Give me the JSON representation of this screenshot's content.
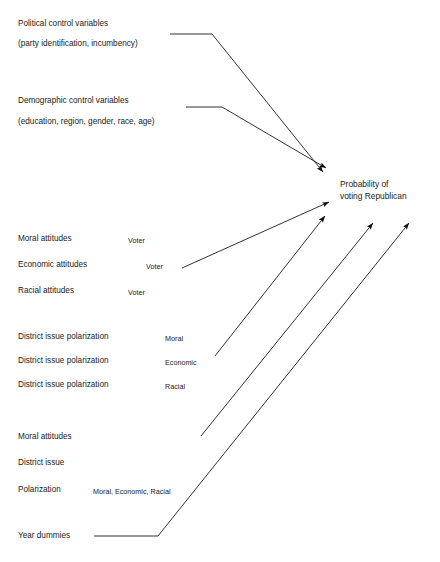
{
  "diagram": {
    "type": "path-diagram",
    "background_color": "#ffffff",
    "line_color": "#1a1a1a",
    "text_color": "#1a1a1a",
    "target": {
      "label": "Probability of\nvoting Republican",
      "line1": "Probability of",
      "line2": "voting Republican",
      "x": 340,
      "y": 178
    },
    "blocks": [
      {
        "id": "political-controls",
        "rows": [
          {
            "main": "Political control variables",
            "sub": "",
            "sub_x": 0,
            "y": 20
          },
          {
            "main": "(party identification, incumbency)",
            "sub": "",
            "sub_x": 0,
            "y": 40
          }
        ]
      },
      {
        "id": "demographic-controls",
        "rows": [
          {
            "main": "Demographic control variables",
            "sub": "",
            "sub_x": 0,
            "y": 97
          },
          {
            "main": "(education, region, gender, race, age)",
            "sub": "",
            "sub_x": 0,
            "y": 118
          }
        ]
      },
      {
        "id": "voter-attitudes",
        "rows": [
          {
            "main": "Moral attitudes",
            "sub": "Voter",
            "sub_x": 128,
            "y": 235
          },
          {
            "main": "Economic attitudes",
            "sub": "Voter",
            "sub_x": 146,
            "y": 261
          },
          {
            "main": "Racial attitudes",
            "sub": "Voter",
            "sub_x": 128,
            "y": 287
          }
        ]
      },
      {
        "id": "district-issue-polarization",
        "rows": [
          {
            "main": "District issue polarization",
            "sub": "Moral",
            "sub_x": 165,
            "y": 333
          },
          {
            "main": "District issue polarization",
            "sub": "Economic",
            "sub_x": 165,
            "y": 357
          },
          {
            "main": "District issue polarization",
            "sub": "Racial",
            "sub_x": 165,
            "y": 381
          }
        ]
      },
      {
        "id": "moral-district-polarization",
        "rows": [
          {
            "main": "Moral attitudes",
            "sub": "",
            "sub_x": 0,
            "y": 433
          },
          {
            "main": "District issue",
            "sub": "",
            "sub_x": 0,
            "y": 459
          },
          {
            "main": "Polarization",
            "sub": "Moral, Economic, Racial",
            "sub_x": 93,
            "y": 486
          }
        ]
      },
      {
        "id": "year-dummies",
        "rows": [
          {
            "main": "Year dummies",
            "sub": "",
            "sub_x": 0,
            "y": 532
          }
        ]
      }
    ],
    "arrows": [
      {
        "id": "arrow-political-controls",
        "from": "political-controls",
        "to": "target",
        "kind": "elbow",
        "points": "170,34 212,34 323,172"
      },
      {
        "id": "arrow-demographic-controls",
        "from": "demographic-controls",
        "to": "target",
        "kind": "elbow",
        "points": "186,107 222,107 326,168"
      },
      {
        "id": "arrow-voter-attitudes",
        "from": "voter-attitudes",
        "to": "target",
        "kind": "straight",
        "points": "182,268 329,202"
      },
      {
        "id": "arrow-district-issue-polarization",
        "from": "district-issue-polarization",
        "to": "target",
        "kind": "straight",
        "points": "215,356 325,216"
      },
      {
        "id": "arrow-moral-district-polarization",
        "from": "moral-district-polarization",
        "to": "target",
        "kind": "straight",
        "points": "201,436 373,223"
      },
      {
        "id": "arrow-year-dummies",
        "from": "year-dummies",
        "to": "target",
        "kind": "elbow",
        "points": "94,536 158,536 409,223"
      }
    ]
  }
}
